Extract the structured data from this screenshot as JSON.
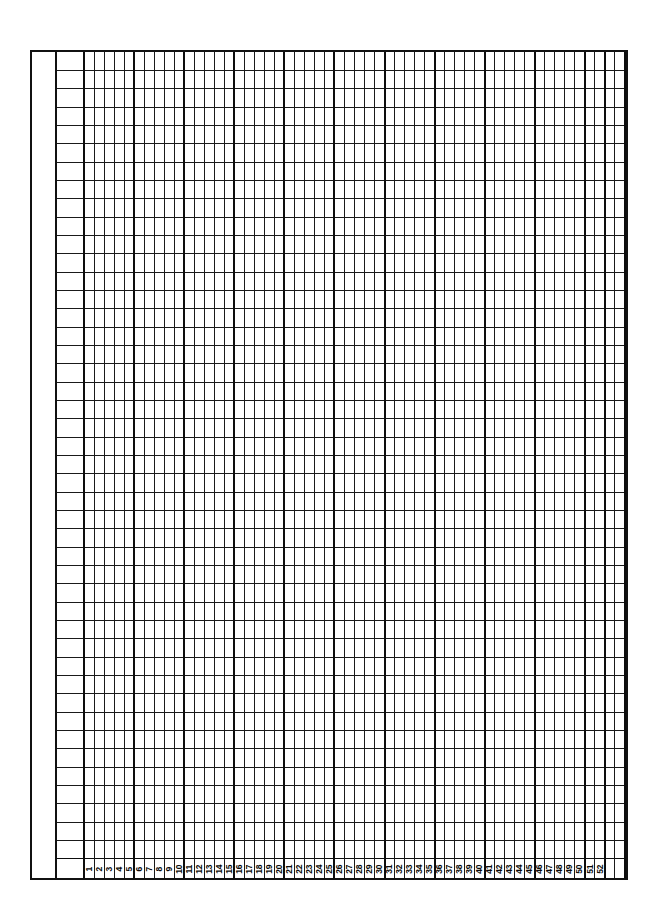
{
  "document": {
    "kind": "blank-ruled-tally-grid-form",
    "description": "Blank pre-printed ruled accounting / tally sheet with numbered columns",
    "page_background": "#ffffff",
    "ink_color": "#111111"
  },
  "grid": {
    "outer_border_px": 2.5,
    "rows": 45,
    "row_height_px": 18.2,
    "numbered_columns": 52,
    "leading_wide_columns": 1,
    "trailing_columns": 2,
    "column_width_px": 9.9,
    "wide_column_width_px": 27,
    "major_vline_every": 5,
    "margin_strip_width_px": 25,
    "frame": {
      "left": 30,
      "top": 50,
      "width": 598,
      "height": 830
    }
  },
  "column_labels": [
    "1",
    "2",
    "3",
    "4",
    "5",
    "6",
    "7",
    "8",
    "9",
    "10",
    "11",
    "12",
    "13",
    "14",
    "15",
    "16",
    "17",
    "18",
    "19",
    "20",
    "21",
    "22",
    "23",
    "24",
    "25",
    "26",
    "27",
    "28",
    "29",
    "30",
    "31",
    "32",
    "33",
    "34",
    "35",
    "36",
    "37",
    "38",
    "39",
    "40",
    "41",
    "42",
    "43",
    "44",
    "45",
    "46",
    "47",
    "48",
    "49",
    "50",
    "51",
    "52"
  ]
}
